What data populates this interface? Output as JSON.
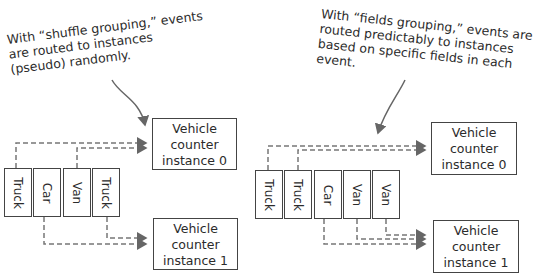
{
  "shuffle_panel": {
    "annotation": [
      "With “shuffle grouping,” events",
      "are routed to instances",
      "(pseudo) randomly."
    ],
    "events": [
      "Truck",
      "Car",
      "Van",
      "Truck"
    ],
    "instances": [
      {
        "line1": "Vehicle",
        "line2": "counter",
        "line3": "instance 0"
      },
      {
        "line1": "Vehicle",
        "line2": "counter",
        "line3": "instance 1"
      }
    ],
    "routing": {
      "instance_0": [
        "Truck",
        "Van"
      ],
      "instance_1": [
        "Car",
        "Truck"
      ]
    }
  },
  "fields_panel": {
    "annotation": [
      "With “fields grouping,” events are",
      "routed predictably to instances",
      "based on specific fields in each",
      "event."
    ],
    "events": [
      "Truck",
      "Truck",
      "Car",
      "Van",
      "Van"
    ],
    "instances": [
      {
        "line1": "Vehicle",
        "line2": "counter",
        "line3": "instance 0"
      },
      {
        "line1": "Vehicle",
        "line2": "counter",
        "line3": "instance 1"
      }
    ],
    "routing": {
      "instance_0": [
        "Truck",
        "Truck"
      ],
      "instance_1": [
        "Car",
        "Van",
        "Van"
      ]
    }
  },
  "colors": {
    "ink": "#2b2b2b",
    "border": "#444444",
    "dashed": "#777777"
  }
}
